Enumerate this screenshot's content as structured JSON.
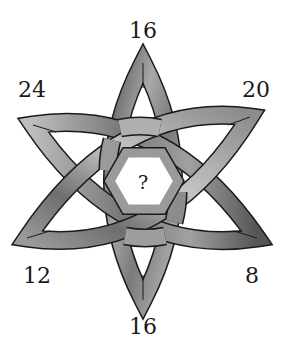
{
  "puzzle": {
    "type": "celtic-knot-number-puzzle",
    "center_label": "?",
    "points": [
      {
        "position": "top",
        "value": "16",
        "x": 143,
        "y": 31
      },
      {
        "position": "upper-right",
        "value": "20",
        "x": 256,
        "y": 90
      },
      {
        "position": "lower-right",
        "value": "8",
        "x": 252,
        "y": 276
      },
      {
        "position": "bottom",
        "value": "16",
        "x": 143,
        "y": 327
      },
      {
        "position": "lower-left",
        "value": "12",
        "x": 37,
        "y": 276
      },
      {
        "position": "upper-left",
        "value": "24",
        "x": 32,
        "y": 90
      }
    ],
    "colors": {
      "band_light": "#c8c8c8",
      "band_mid": "#8a8a8a",
      "band_dark": "#4a4a4a",
      "outline": "#1a1a1a",
      "background": "#ffffff"
    }
  }
}
